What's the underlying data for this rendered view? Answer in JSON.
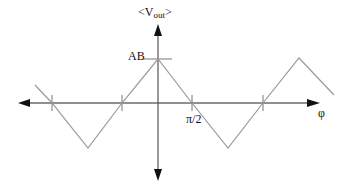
{
  "diagram": {
    "type": "triangular-wave-plot",
    "y_axis_label": {
      "prefix": "<V",
      "subscript": "out",
      "suffix": ">"
    },
    "x_axis_label": "φ",
    "peak_label": "AB",
    "tick_label": "π/2",
    "colors": {
      "axis": "#222222",
      "wave": "#9a9a9a",
      "text": "#111111"
    },
    "wave_points": [
      [
        35,
        85
      ],
      [
        52,
        103
      ],
      [
        88,
        148
      ],
      [
        122,
        103
      ],
      [
        158,
        59
      ],
      [
        192,
        103
      ],
      [
        228,
        148
      ],
      [
        263,
        103
      ],
      [
        299,
        58
      ],
      [
        334,
        95
      ]
    ],
    "x_ticks": [
      52,
      122,
      192,
      263
    ],
    "axis_origin": [
      158,
      103
    ]
  }
}
